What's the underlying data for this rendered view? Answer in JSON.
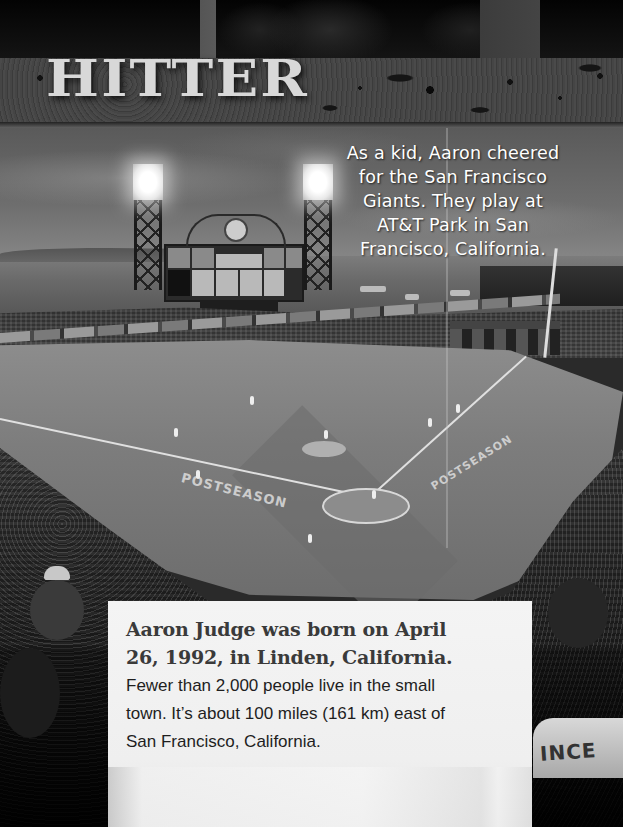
{
  "header": {
    "title": "HITTER"
  },
  "photo": {
    "description": "Black-and-white aerial view of AT&T Park baseball stadium at dusk during a postseason game",
    "field_markings": [
      "POSTSEASON",
      "POSTSEASON"
    ],
    "signage": [
      "VISA",
      "LOVE LANDING"
    ],
    "jersey_fragment": "INCE"
  },
  "caption": {
    "lines": [
      "As a kid, Aaron cheered",
      "for the San Francisco",
      "Giants. They play at",
      "AT&T Park in San",
      "Francisco, California."
    ]
  },
  "textbox": {
    "lead_lines": [
      "Aaron Judge was born on April",
      "26, 1992, in Linden, California."
    ],
    "body_lines": [
      "Fewer than 2,000 people live in the small",
      "town. It’s about 100 miles (161 km) east of",
      "San Francisco, California."
    ]
  }
}
